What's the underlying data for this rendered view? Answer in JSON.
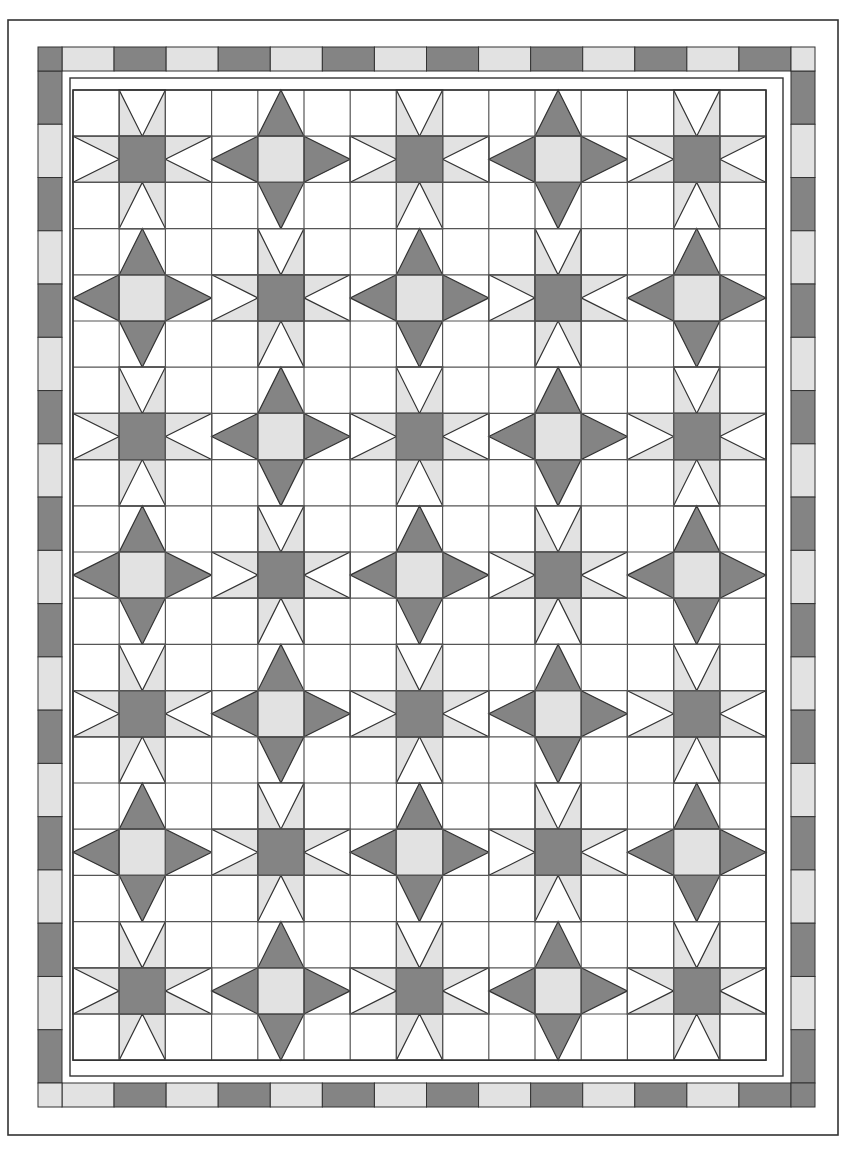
{
  "document": {
    "title": "Quilt Block Layout Diagram",
    "type": "quilt-pattern-schematic"
  },
  "colors": {
    "background": "#ffffff",
    "dark_fabric": "#848484",
    "light_fabric": "#e2e2e2",
    "white_fabric": "#ffffff",
    "outline": "#333333",
    "outline_thin": "#555555"
  },
  "canvas": {
    "width": 857,
    "height": 1149
  },
  "outer_frame": {
    "name": "outer-binding-frame",
    "x": 8,
    "y": 20,
    "width": 830,
    "height": 1115,
    "stroke_width": 1.6
  },
  "checkered_border": {
    "name": "piano-key-checkered-border",
    "x": 38,
    "y": 47,
    "width": 777,
    "height": 1060,
    "band": 24,
    "horizontal_segments": 14,
    "vertical_segments": 19,
    "start_color": "light",
    "sequence": [
      "light",
      "dark"
    ]
  },
  "inner_frame": {
    "name": "inner-sashing-frame",
    "x": 70,
    "y": 78,
    "width": 713,
    "height": 998,
    "stroke_width": 1.4
  },
  "grid": {
    "name": "patchwork-grid",
    "x": 73,
    "y": 90,
    "cols": 15,
    "rows": 21,
    "cell": 46.2,
    "stroke_width": 1.2
  },
  "stars": {
    "name": "star-block-layout",
    "center_cols": [
      1,
      4,
      7,
      10,
      13
    ],
    "center_rows": [
      1,
      4,
      7,
      10,
      13,
      16,
      19
    ],
    "type_a": {
      "label": "sawtooth-star-dark-center",
      "center_fill": "dark_fabric",
      "point_fill": "light_fabric",
      "point_style": "flying-geese-notched"
    },
    "type_b": {
      "label": "diamond-star-light-center",
      "center_fill": "light_fabric",
      "point_fill": "dark_fabric",
      "point_style": "solid-triangle"
    },
    "alternation_rule": "checkerboard-by-index-parity"
  },
  "legend": {
    "dark_label": "Dark fabric",
    "light_label": "Light fabric",
    "background_label": "Background fabric"
  }
}
